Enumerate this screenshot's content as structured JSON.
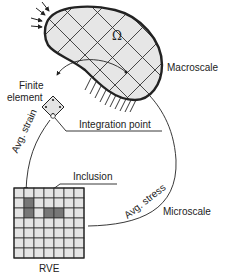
{
  "diagram": {
    "domain_symbol": "Ω",
    "labels": {
      "macroscale": "Macroscale",
      "microscale": "Microscale",
      "finite_element_line1": "Finite",
      "finite_element_line2": "element",
      "integration_point": "Integration point",
      "avg_strain": "Avg. strain",
      "avg_stress": "Avg. stress",
      "inclusion": "Inclusion",
      "rve": "RVE"
    },
    "colors": {
      "domain_fill": "#e6e6e6",
      "outline": "#222222",
      "inclusion_fill": "#777777",
      "cell_fill": "#e4e4e4"
    }
  }
}
